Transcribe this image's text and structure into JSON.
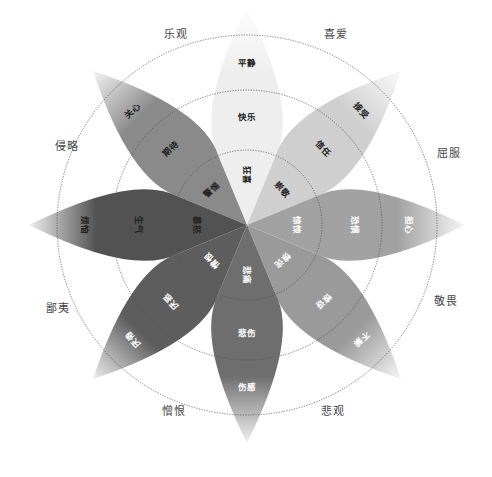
{
  "diagram": {
    "title": "",
    "center": [
      247,
      225
    ],
    "rings": [
      75,
      135,
      190
    ],
    "petals": [
      {
        "id": "joy",
        "angle": -90,
        "color": "#eeeeee",
        "tip": true,
        "labels": [
          {
            "text": "狂喜",
            "ring": 0,
            "dark": true,
            "vertical": true
          },
          {
            "text": "快乐",
            "ring": 1,
            "dark": true
          },
          {
            "text": "平静",
            "ring": 2,
            "dark": true
          }
        ]
      },
      {
        "id": "trust",
        "angle": -45,
        "color": "#cfcfcf",
        "tip": true,
        "labels": [
          {
            "text": "崇敬",
            "ring": 0,
            "dark": true
          },
          {
            "text": "信任",
            "ring": 1,
            "dark": true
          },
          {
            "text": "接受",
            "ring": 2,
            "dark": true
          }
        ]
      },
      {
        "id": "fear",
        "angle": 0,
        "color": "#a2a2a2",
        "tip": true,
        "labels": [
          {
            "text": "惊悚",
            "ring": 0,
            "dark": false
          },
          {
            "text": "恐惧",
            "ring": 1,
            "dark": false
          },
          {
            "text": "担心",
            "ring": 2,
            "dark": false
          }
        ]
      },
      {
        "id": "surprise",
        "angle": 45,
        "color": "#9a9a9a",
        "tip": true,
        "labels": [
          {
            "text": "惊诧",
            "ring": 0,
            "dark": false
          },
          {
            "text": "惊讶",
            "ring": 1,
            "dark": false
          },
          {
            "text": "不解",
            "ring": 2,
            "dark": false
          }
        ]
      },
      {
        "id": "sadness",
        "angle": 90,
        "color": "#6e6e6e",
        "tip": true,
        "labels": [
          {
            "text": "悲痛",
            "ring": 0,
            "dark": false,
            "vertical": true
          },
          {
            "text": "悲伤",
            "ring": 1,
            "dark": false
          },
          {
            "text": "伤感",
            "ring": 2,
            "dark": false
          }
        ]
      },
      {
        "id": "disgust",
        "angle": 135,
        "color": "#5d5d5d",
        "tip": true,
        "labels": [
          {
            "text": "憎恨",
            "ring": 0,
            "dark": false
          },
          {
            "text": "厌恶",
            "ring": 1,
            "dark": false
          },
          {
            "text": "厌倦",
            "ring": 2,
            "dark": false
          }
        ]
      },
      {
        "id": "anger",
        "angle": 180,
        "color": "#525252",
        "tip": true,
        "labels": [
          {
            "text": "暴怒",
            "ring": 0,
            "dark": true
          },
          {
            "text": "生气",
            "ring": 1,
            "dark": true
          },
          {
            "text": "烦恼",
            "ring": 2,
            "dark": true
          }
        ]
      },
      {
        "id": "anticipation",
        "angle": -135,
        "color": "#8a8a8a",
        "tip": true,
        "labels": [
          {
            "text": "警惕",
            "ring": 0,
            "dark": true
          },
          {
            "text": "期待",
            "ring": 1,
            "dark": true
          },
          {
            "text": "关心",
            "ring": 2,
            "dark": true
          }
        ]
      }
    ],
    "dyads": [
      {
        "text": "乐观",
        "x": 176,
        "y": 33
      },
      {
        "text": "喜爱",
        "x": 336,
        "y": 33
      },
      {
        "text": "屈服",
        "x": 449,
        "y": 152
      },
      {
        "text": "敬畏",
        "x": 446,
        "y": 300
      },
      {
        "text": "悲观",
        "x": 333,
        "y": 410
      },
      {
        "text": "憎恨",
        "x": 174,
        "y": 410
      },
      {
        "text": "鄙夷",
        "x": 58,
        "y": 307
      },
      {
        "text": "侵略",
        "x": 67,
        "y": 145
      }
    ]
  }
}
